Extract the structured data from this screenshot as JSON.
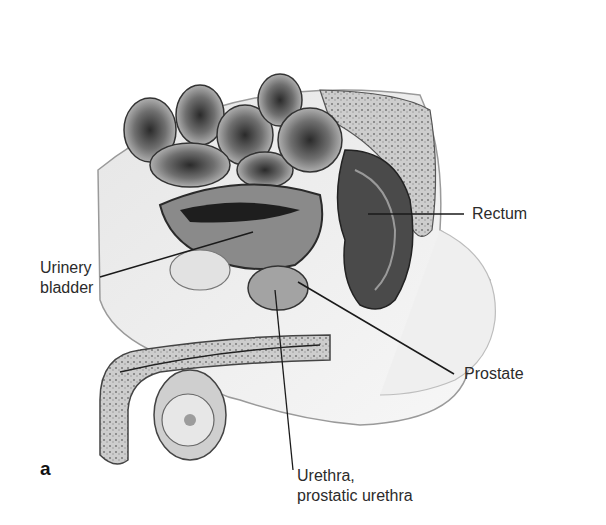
{
  "figure": {
    "panel_letter": "a",
    "colors": {
      "background": "#ffffff",
      "label_text": "#2b2b2b",
      "leader_line": "#1a1a1a",
      "tissue_dark": "#3a3a3a",
      "tissue_mid": "#8c8c8c",
      "tissue_light": "#d9d9d9"
    },
    "labels": [
      {
        "id": "urinary-bladder",
        "lines": [
          "Urinery",
          "bladder"
        ],
        "text_x": 40,
        "text_y": 258,
        "line": [
          100,
          277,
          253,
          232
        ]
      },
      {
        "id": "rectum",
        "lines": [
          "Rectum"
        ],
        "text_x": 472,
        "text_y": 204,
        "line": [
          368,
          214,
          464,
          214
        ]
      },
      {
        "id": "prostate",
        "lines": [
          "Prostate"
        ],
        "text_x": 464,
        "text_y": 364,
        "line": [
          298,
          282,
          454,
          374
        ]
      },
      {
        "id": "urethra",
        "lines": [
          "Urethra,",
          "prostatic urethra"
        ],
        "text_x": 293,
        "text_y": 469,
        "line": [
          275,
          290,
          293,
          470
        ]
      }
    ]
  }
}
